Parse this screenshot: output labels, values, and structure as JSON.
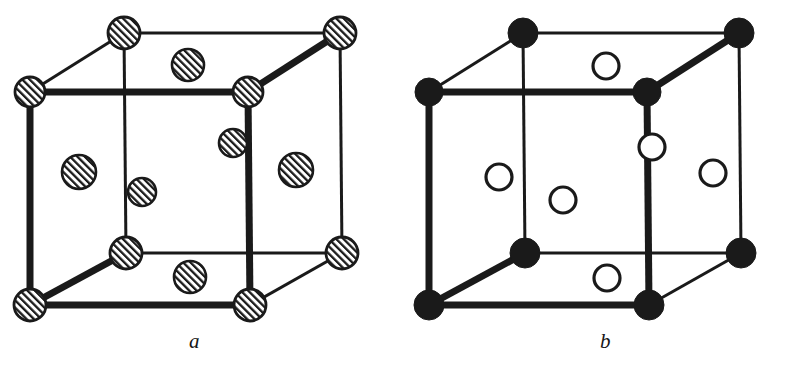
{
  "figure": {
    "kind": "crystal-unit-cell-pair",
    "background_color": "#ffffff",
    "line_color": "#1a1a1a",
    "panels": [
      {
        "id": "a",
        "label": "a",
        "description": "Face-centred cubic unit cell with all atoms shown as hatched circles",
        "atom_style": "hatched",
        "hatch_angle_deg": 45,
        "cube": {
          "front_top_left": [
            30,
            92
          ],
          "front_top_right": [
            248,
            92
          ],
          "front_bottom_left": [
            30,
            305
          ],
          "front_bottom_right": [
            250,
            305
          ],
          "back_top_left": [
            124,
            33
          ],
          "back_top_right": [
            340,
            33
          ],
          "back_bottom_left": [
            126,
            253
          ],
          "back_bottom_right": [
            342,
            253
          ]
        },
        "corner_atoms": [
          {
            "name": "front-top-left",
            "cx": 30,
            "cy": 92,
            "r": 15
          },
          {
            "name": "front-top-right",
            "cx": 248,
            "cy": 92,
            "r": 15
          },
          {
            "name": "front-bottom-left",
            "cx": 30,
            "cy": 305,
            "r": 16
          },
          {
            "name": "front-bottom-right",
            "cx": 250,
            "cy": 305,
            "r": 16
          },
          {
            "name": "back-top-left",
            "cx": 124,
            "cy": 33,
            "r": 16
          },
          {
            "name": "back-top-right",
            "cx": 340,
            "cy": 33,
            "r": 16
          },
          {
            "name": "back-bottom-left",
            "cx": 126,
            "cy": 253,
            "r": 16
          },
          {
            "name": "back-bottom-right",
            "cx": 342,
            "cy": 253,
            "r": 16
          }
        ],
        "face_atoms": [
          {
            "name": "top-face-center",
            "cx": 188,
            "cy": 65,
            "r": 16
          },
          {
            "name": "bottom-face-center",
            "cx": 190,
            "cy": 277,
            "r": 16
          },
          {
            "name": "left-face-center",
            "cx": 79,
            "cy": 172,
            "r": 17
          },
          {
            "name": "right-face-center",
            "cx": 296,
            "cy": 170,
            "r": 17
          },
          {
            "name": "back-face-center",
            "cx": 233,
            "cy": 143,
            "r": 14
          },
          {
            "name": "front-face-center",
            "cx": 142,
            "cy": 192,
            "r": 14
          }
        ]
      },
      {
        "id": "b",
        "label": "b",
        "description": "Cubic unit cell of two atom species: solid corner atoms and open face-centre atoms",
        "atom_style": "two-species",
        "cube": {
          "front_top_left": [
            30,
            92
          ],
          "front_top_right": [
            248,
            92
          ],
          "front_bottom_left": [
            30,
            305
          ],
          "front_bottom_right": [
            250,
            305
          ],
          "back_top_left": [
            124,
            33
          ],
          "back_top_right": [
            340,
            33
          ],
          "back_bottom_left": [
            126,
            253
          ],
          "back_bottom_right": [
            342,
            253
          ]
        },
        "corner_atoms": [
          {
            "name": "front-top-left",
            "cx": 30,
            "cy": 92,
            "r": 14
          },
          {
            "name": "front-top-right",
            "cx": 248,
            "cy": 92,
            "r": 14
          },
          {
            "name": "front-bottom-left",
            "cx": 30,
            "cy": 305,
            "r": 15
          },
          {
            "name": "front-bottom-right",
            "cx": 250,
            "cy": 305,
            "r": 15
          },
          {
            "name": "back-top-left",
            "cx": 124,
            "cy": 33,
            "r": 15
          },
          {
            "name": "back-top-right",
            "cx": 340,
            "cy": 33,
            "r": 15
          },
          {
            "name": "back-bottom-left",
            "cx": 126,
            "cy": 253,
            "r": 15
          },
          {
            "name": "back-bottom-right",
            "cx": 342,
            "cy": 253,
            "r": 15
          }
        ],
        "face_atoms": [
          {
            "name": "top-face-center",
            "cx": 207,
            "cy": 66,
            "r": 13
          },
          {
            "name": "bottom-face-center",
            "cx": 208,
            "cy": 278,
            "r": 13
          },
          {
            "name": "left-face-center",
            "cx": 100,
            "cy": 177,
            "r": 13
          },
          {
            "name": "right-face-center",
            "cx": 314,
            "cy": 173,
            "r": 13
          },
          {
            "name": "back-face-center",
            "cx": 253,
            "cy": 147,
            "r": 13
          },
          {
            "name": "front-face-center",
            "cx": 164,
            "cy": 200,
            "r": 13
          }
        ]
      }
    ]
  }
}
